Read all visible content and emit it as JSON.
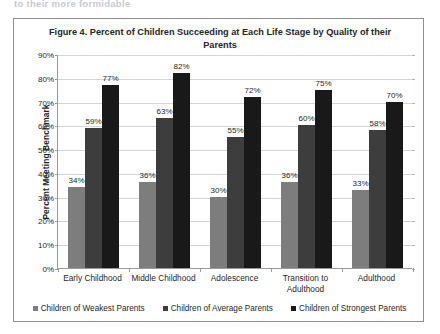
{
  "scan": {
    "top_cut_text": "to their more formidable"
  },
  "figure": {
    "title": "Figure 4. Percent of Children Succeeding at Each Life Stage by Quality of their Parents"
  },
  "chart_data": {
    "type": "bar",
    "title": "Figure 4. Percent of Children Succeeding at Each Life Stage by Quality of their Parents",
    "xlabel": "",
    "ylabel": "Percent Meeting Benchmark",
    "ylim": [
      0,
      90
    ],
    "ytick_labels": [
      "0%",
      "10%",
      "20%",
      "30%",
      "40%",
      "50%",
      "60%",
      "70%",
      "80%",
      "90%"
    ],
    "ytick_values": [
      0,
      10,
      20,
      30,
      40,
      50,
      60,
      70,
      80,
      90
    ],
    "grid": true,
    "legend_position": "bottom",
    "value_suffix": "%",
    "categories": [
      "Early Childhood",
      "Middle Childhood",
      "Adolescence",
      "Transition to Adulthood",
      "Adulthood"
    ],
    "series": [
      {
        "name": "Children of Weakest Parents",
        "color": "#7d7d7d",
        "values": [
          34,
          36,
          30,
          36,
          33
        ],
        "labels": [
          "34%",
          "36%",
          "30%",
          "36%",
          "33%"
        ]
      },
      {
        "name": "Children of Average Parents",
        "color": "#3d3d3d",
        "values": [
          59,
          63,
          55,
          60,
          58
        ],
        "labels": [
          "59%",
          "63%",
          "55%",
          "60%",
          "58%"
        ]
      },
      {
        "name": "Children of Strongest Parents",
        "color": "#191919",
        "values": [
          77,
          82,
          72,
          75,
          70
        ],
        "labels": [
          "77%",
          "82%",
          "72%",
          "75%",
          "70%"
        ]
      }
    ]
  }
}
